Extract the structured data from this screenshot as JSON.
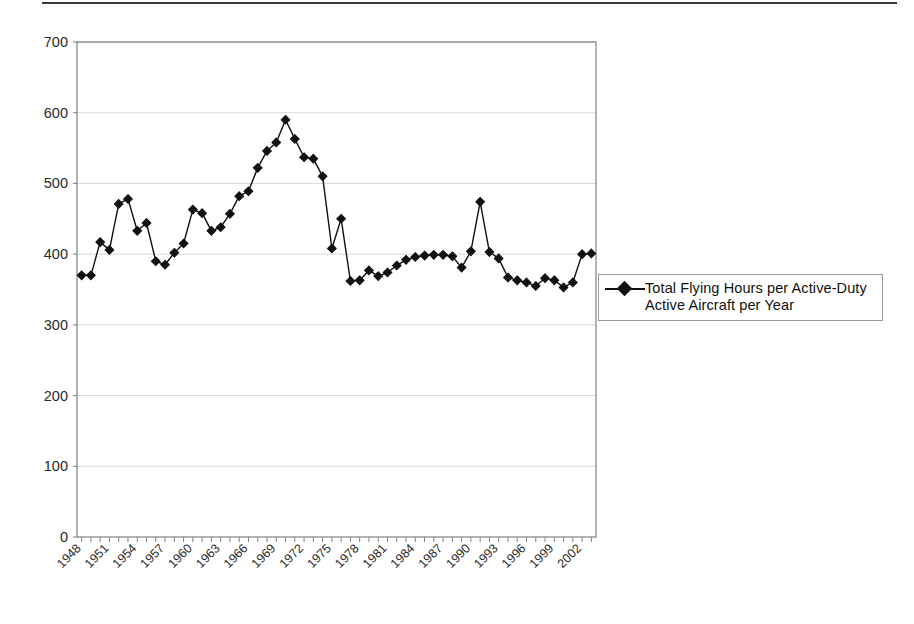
{
  "figure": {
    "background_color": "#ffffff",
    "axis_color": "#808080",
    "series_color": "#111111",
    "gridline_color": "#d9d9d9",
    "top_rule_color": "#3a3a3a"
  },
  "legend": {
    "position": "right",
    "marker": "diamond-marker",
    "entries": [
      {
        "label": "Total Flying Hours per Active-Duty\nActive Aircraft per Year"
      }
    ]
  },
  "chart_data": {
    "type": "line",
    "title": "",
    "subtitle": "",
    "xlabel": "",
    "ylabel": "",
    "ylim": [
      0,
      700
    ],
    "ytick_step": 100,
    "ytick_labels": [
      "0",
      "100",
      "200",
      "300",
      "400",
      "500",
      "600",
      "700"
    ],
    "grid": true,
    "grid_axis": "y",
    "legend_position": "right",
    "xtick_labels": [
      "1948",
      "1951",
      "1954",
      "1957",
      "1960",
      "1963",
      "1966",
      "1969",
      "1972",
      "1975",
      "1978",
      "1981",
      "1984",
      "1987",
      "1990",
      "1993",
      "1996",
      "1999",
      "2002"
    ],
    "xtick_label_rotation": 45,
    "x": [
      1948,
      1949,
      1950,
      1951,
      1952,
      1953,
      1954,
      1955,
      1956,
      1957,
      1958,
      1959,
      1960,
      1961,
      1962,
      1963,
      1964,
      1965,
      1966,
      1967,
      1968,
      1969,
      1970,
      1971,
      1972,
      1973,
      1974,
      1975,
      1976,
      1977,
      1978,
      1979,
      1980,
      1981,
      1982,
      1983,
      1984,
      1985,
      1986,
      1987,
      1988,
      1989,
      1990,
      1991,
      1992,
      1993,
      1994,
      1995,
      1996,
      1997,
      1998,
      1999,
      2000,
      2001,
      2002,
      2003
    ],
    "series": [
      {
        "name": "Total Flying Hours per Active-Duty Active Aircraft per Year",
        "marker": "diamond",
        "values": [
          370,
          370,
          417,
          406,
          471,
          478,
          433,
          444,
          390,
          385,
          402,
          415,
          463,
          458,
          433,
          438,
          457,
          482,
          489,
          522,
          546,
          558,
          590,
          563,
          537,
          535,
          510,
          408,
          450,
          362,
          363,
          377,
          369,
          374,
          384,
          392,
          396,
          398,
          399,
          399,
          397,
          381,
          404,
          474,
          403,
          394,
          367,
          363,
          360,
          355,
          366,
          363,
          353,
          360,
          400,
          401
        ]
      }
    ]
  }
}
